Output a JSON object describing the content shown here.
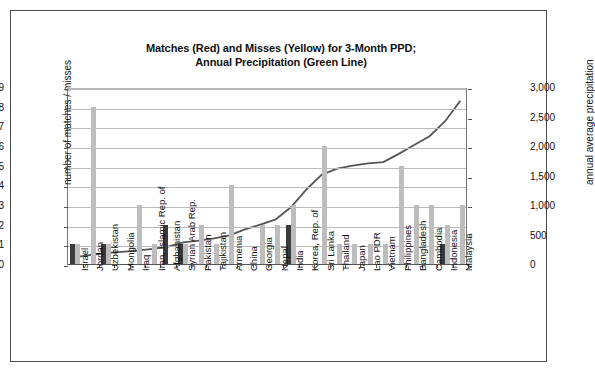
{
  "chart_data": {
    "type": "bar",
    "title": "Matches (Red) and Misses (Yellow) for 3-Month PPD; Annual Precipitation (Green Line)",
    "title_line1": "Matches (Red) and Misses (Yellow) for 3-Month PPD;",
    "title_line2": "Annual Precipitation (Green Line)",
    "xlabel": "",
    "ylabel": "number of matches / misses",
    "y2label": "annual average precipitation",
    "ylim": [
      0,
      9
    ],
    "y2lim": [
      0,
      3000
    ],
    "yticks": [
      "0",
      "1",
      "2",
      "3",
      "4",
      "5",
      "6",
      "7",
      "8",
      "9"
    ],
    "y2ticks": [
      "0",
      "500",
      "1,000",
      "1,500",
      "2,000",
      "2,500",
      "3,000"
    ],
    "grid": true,
    "legend_position": "none",
    "categories": [
      "Israel",
      "Jordan",
      "Uzbekistan",
      "Mongolia",
      "Iraq",
      "Iran, Islamic Rep. of",
      "Afghanistan",
      "Syrian Arab Rep.",
      "Pakistan",
      "Tajikistan",
      "Armenia",
      "China",
      "Georgia",
      "Nepal",
      "India",
      "Korea, Rep. of",
      "Sri Lanka",
      "Thailand",
      "Japan",
      "Lao PDR",
      "Vietnam",
      "Philippines",
      "Bangladesh",
      "Cambodia",
      "Indonesia",
      "Malaysia"
    ],
    "series": [
      {
        "name": "Matches (Red)",
        "color": "#3b3b3b",
        "values": [
          1,
          0,
          1,
          0,
          0,
          0,
          2,
          1,
          0,
          0,
          0,
          0,
          0,
          0,
          2,
          0,
          0,
          0,
          0,
          0,
          0,
          0,
          0,
          0,
          1,
          0
        ]
      },
      {
        "name": "Misses (Yellow)",
        "color": "#bdbdbd",
        "values": [
          1,
          8,
          1,
          0,
          3,
          1,
          0,
          1,
          2,
          1,
          4,
          0,
          2,
          2,
          3,
          0,
          6,
          1,
          1,
          1,
          1,
          5,
          3,
          3,
          2,
          3
        ]
      },
      {
        "name": "Annual Precipitation (Green Line)",
        "color": "#555555",
        "axis": "right",
        "values": [
          150,
          190,
          220,
          240,
          260,
          290,
          330,
          400,
          430,
          470,
          520,
          620,
          700,
          790,
          1000,
          1300,
          1550,
          1650,
          1700,
          1740,
          1760,
          1900,
          2050,
          2200,
          2450,
          2800
        ]
      }
    ]
  }
}
